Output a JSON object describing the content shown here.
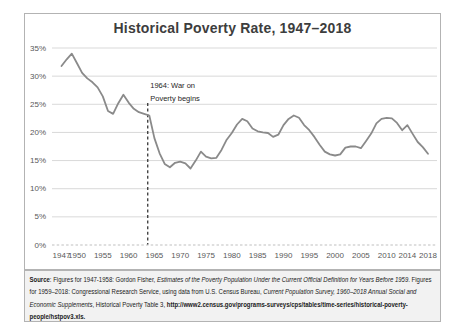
{
  "title": "Historical Poverty Rate, 1947–2018",
  "colors": {
    "line": "#8a8a8a",
    "grid": "#d9d9d9",
    "zero_line": "#bfbfbf",
    "panel_border": "#b3b3b3",
    "source_bg": "#f2f2f2",
    "title_text": "#3d3d3d",
    "axis_text": "#595959",
    "annotation_text": "#262626",
    "annotation_line": "#262626"
  },
  "chart_data": {
    "type": "line",
    "title": "Historical Poverty Rate, 1947–2018",
    "series_name": "Poverty rate (%)",
    "x": [
      1947,
      1948,
      1949,
      1950,
      1951,
      1952,
      1953,
      1954,
      1955,
      1956,
      1957,
      1958,
      1959,
      1960,
      1961,
      1962,
      1963,
      1964,
      1965,
      1966,
      1967,
      1968,
      1969,
      1970,
      1971,
      1972,
      1973,
      1974,
      1975,
      1976,
      1977,
      1978,
      1979,
      1980,
      1981,
      1982,
      1983,
      1984,
      1985,
      1986,
      1987,
      1988,
      1989,
      1990,
      1991,
      1992,
      1993,
      1994,
      1995,
      1996,
      1997,
      1998,
      1999,
      2000,
      2001,
      2002,
      2003,
      2004,
      2005,
      2006,
      2007,
      2008,
      2009,
      2010,
      2011,
      2012,
      2013,
      2014,
      2015,
      2016,
      2017,
      2018
    ],
    "values": [
      31.8,
      33.0,
      34.0,
      32.3,
      30.6,
      29.6,
      28.9,
      28.0,
      26.4,
      23.8,
      23.3,
      25.2,
      26.7,
      25.3,
      24.2,
      23.6,
      23.3,
      23.0,
      19.0,
      16.3,
      14.4,
      13.8,
      14.6,
      14.8,
      14.5,
      13.6,
      15.0,
      16.6,
      15.7,
      15.4,
      15.5,
      16.9,
      18.7,
      19.9,
      21.4,
      22.4,
      22.0,
      20.7,
      20.2,
      20.0,
      19.9,
      19.2,
      19.6,
      21.3,
      22.4,
      23.0,
      22.6,
      21.3,
      20.4,
      19.2,
      17.8,
      16.6,
      16.1,
      15.9,
      16.1,
      17.3,
      17.5,
      17.5,
      17.2,
      18.5,
      19.8,
      21.6,
      22.4,
      22.6,
      22.5,
      21.7,
      20.4,
      21.3,
      19.8,
      18.3,
      17.4,
      16.2
    ],
    "ylim": [
      0,
      35
    ],
    "yticks": [
      0,
      5,
      10,
      15,
      20,
      25,
      30,
      35
    ],
    "ytick_labels": [
      "0%",
      "5%",
      "10%",
      "15%",
      "20%",
      "25%",
      "30%",
      "35%"
    ],
    "xticks": [
      1947,
      1950,
      1955,
      1960,
      1965,
      1970,
      1975,
      1980,
      1985,
      1990,
      1995,
      2000,
      2005,
      2010,
      2014,
      2018
    ],
    "xtick_labels": [
      "1947",
      "1950",
      "1955",
      "1960",
      "1965",
      "1970",
      "1975",
      "1980",
      "1985",
      "1990",
      "1995",
      "2000",
      "2005",
      "2010",
      "2014",
      "2018"
    ],
    "grid": true,
    "legend": false,
    "annotation": {
      "x": 1964,
      "text_line1": "1964: War on",
      "text_line2": "Poverty begins"
    }
  },
  "source": {
    "segments": [
      {
        "text": "Source",
        "style": "b"
      },
      {
        "text": ": Figures for 1947-1958: Gordon Fisher, ",
        "style": ""
      },
      {
        "text": "Estimates of the Poverty Population Under the Current Official Definition for Years Before 1959",
        "style": "i"
      },
      {
        "text": ". Figures for 1959–2018: Congressional Research Service, using data from U.S. Census Bureau, ",
        "style": ""
      },
      {
        "text": "Current Population Survey, 1960–2018 Annual Social and Economic Supplements",
        "style": "i"
      },
      {
        "text": ", Historical Poverty Table 3, ",
        "style": ""
      },
      {
        "text": "http://www2.census.gov/programs-surveys/cps/tables/time-series/historical-poverty-people/hstpov3.xls.",
        "style": "b"
      }
    ]
  }
}
